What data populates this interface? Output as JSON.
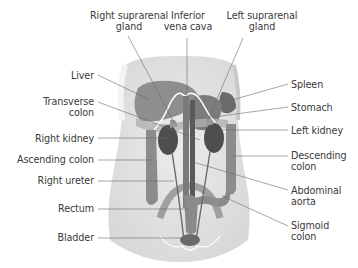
{
  "figure": {
    "type": "anatomical diagram",
    "colors": {
      "background": "#ffffff",
      "body_outline": "#d8d8d8",
      "organ_dark": "#5a5a5a",
      "organ_mid": "#8a8a8a",
      "organ_light": "#a8a8a8",
      "leader_line": "#6a6a6a",
      "label_text": "#3a3a3a"
    }
  },
  "labels": {
    "top": [
      {
        "id": "right-suprarenal-gland",
        "line1": "Right suprarenal",
        "line2": "gland"
      },
      {
        "id": "inferior-vena-cava",
        "line1": "Inferior",
        "line2": "vena cava"
      },
      {
        "id": "left-suprarenal-gland",
        "line1": "Left suprarenal",
        "line2": "gland"
      }
    ],
    "left": [
      {
        "id": "liver",
        "line1": "Liver"
      },
      {
        "id": "transverse-colon",
        "line1": "Transverse",
        "line2": "colon"
      },
      {
        "id": "right-kidney",
        "line1": "Right kidney"
      },
      {
        "id": "ascending-colon",
        "line1": "Ascending colon"
      },
      {
        "id": "right-ureter",
        "line1": "Right ureter"
      },
      {
        "id": "rectum",
        "line1": "Rectum"
      },
      {
        "id": "bladder",
        "line1": "Bladder"
      }
    ],
    "right": [
      {
        "id": "spleen",
        "line1": "Spleen"
      },
      {
        "id": "stomach",
        "line1": "Stomach"
      },
      {
        "id": "left-kidney",
        "line1": "Left kidney"
      },
      {
        "id": "descending-colon",
        "line1": "Descending",
        "line2": "colon"
      },
      {
        "id": "abdominal-aorta",
        "line1": "Abdominal",
        "line2": "aorta"
      },
      {
        "id": "sigmoid-colon",
        "line1": "Sigmoid",
        "line2": "colon"
      }
    ]
  }
}
